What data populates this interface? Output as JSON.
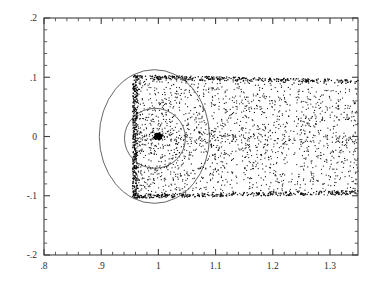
{
  "figure": {
    "name": "scatter-plot-with-circles",
    "background_color": "#ffffff",
    "ink_color": "#222222"
  },
  "axes": {
    "x_axis": {
      "label": "",
      "min": 0.8,
      "max": 1.349,
      "major_ticks": [
        0.8,
        0.9,
        1.0,
        1.1,
        1.2,
        1.3
      ],
      "major_tick_labels": [
        ".8",
        ".9",
        "1",
        "1.1",
        "1.2",
        "1.3"
      ],
      "minor_tick_step": 0.02,
      "tick_direction": "inward"
    },
    "y_axis": {
      "label": "",
      "min": -0.2,
      "max": 0.2,
      "major_ticks": [
        -0.2,
        -0.1,
        0.0,
        0.1,
        0.2
      ],
      "major_tick_labels": [
        "-.2",
        "-.1",
        "0",
        ".1",
        ".2"
      ],
      "minor_tick_step": 0.02,
      "tick_direction": "inward"
    },
    "frame": {
      "left_px": 44,
      "right_px": 358,
      "top_px": 18,
      "bottom_px": 255,
      "all_sides_drawn": true
    }
  },
  "chart_data": {
    "type": "scatter",
    "title": "",
    "xlabel": "",
    "ylabel": "",
    "xlim": [
      0.8,
      1.349
    ],
    "ylim": [
      -0.2,
      0.2
    ],
    "grid": false,
    "legend_position": "none",
    "marker": {
      "shape": "dot",
      "size_px": 1.2,
      "color": "#111111"
    },
    "series": [
      {
        "name": "scatter-band",
        "point_count_approx": 2600,
        "region": {
          "x_start": 0.955,
          "x_end": 1.349,
          "y_top_at_xstart": 0.104,
          "y_bottom_at_xstart": -0.104,
          "y_top_at_xend": 0.096,
          "y_bottom_at_xend": -0.098
        },
        "boundary_enhancement": {
          "top_edge": "high",
          "bottom_edge": "high",
          "left_edge": "very high",
          "right_edge": "none"
        },
        "interior_density": "moderate, slowly decreasing toward larger x"
      },
      {
        "name": "central-core-cluster",
        "point_count_approx": 90,
        "center": [
          1.0,
          0.0
        ],
        "radius": 0.006,
        "note": "saturated black blob at the band centre"
      }
    ],
    "overlays": [
      {
        "name": "outer-circle",
        "type": "circle",
        "center_x": 0.993,
        "center_y": 0.0,
        "radius_x": 0.0963,
        "radius_y": 0.1128,
        "stroke": "#4a4a4a",
        "fill": "none"
      },
      {
        "name": "inner-circle",
        "type": "circle",
        "center_x": 0.994,
        "center_y": -0.003,
        "radius_x": 0.0533,
        "radius_y": 0.0506,
        "stroke": "#4a4a4a",
        "fill": "none"
      }
    ]
  }
}
